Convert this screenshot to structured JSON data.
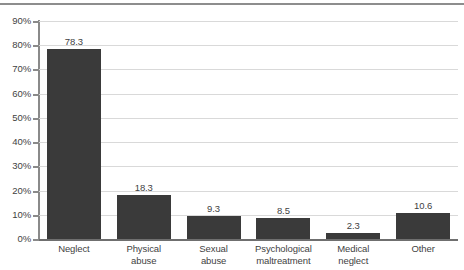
{
  "chart_data": {
    "type": "bar",
    "title": "",
    "subtitle": "",
    "xlabel": "",
    "ylabel": "",
    "categories": [
      "Neglect",
      "Physical abuse",
      "Sexual abuse",
      "Psychological maltreatment",
      "Medical neglect",
      "Other"
    ],
    "category_lines": [
      [
        "Neglect"
      ],
      [
        "Physical",
        "abuse"
      ],
      [
        "Sexual",
        "abuse"
      ],
      [
        "Psychological",
        "maltreatment"
      ],
      [
        "Medical",
        "neglect"
      ],
      [
        "Other"
      ]
    ],
    "values": [
      78.3,
      18.3,
      9.3,
      8.5,
      2.3,
      10.6
    ],
    "value_labels": [
      "78.3",
      "18.3",
      "9.3",
      "8.5",
      "2.3",
      "10.6"
    ],
    "ylim": [
      0,
      90
    ],
    "ytick_values": [
      0,
      10,
      20,
      30,
      40,
      50,
      60,
      70,
      80,
      90
    ],
    "ytick_labels": [
      "0%",
      "10%",
      "20%",
      "30%",
      "40%",
      "50%",
      "60%",
      "70%",
      "80%",
      "90%"
    ],
    "grid": true,
    "legend": "none",
    "bar_color": "#3a3a3a",
    "gridline_color": "#d9d9d9",
    "axis_color": "#8a8a8a",
    "background_color": "#ffffff"
  }
}
